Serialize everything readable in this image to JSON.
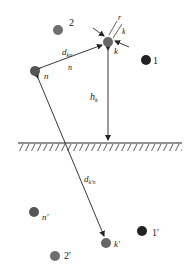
{
  "diagram": {
    "type": "antenna-element-image-method",
    "ground": {
      "label": "ground-plane",
      "y": 143,
      "x1": 18,
      "x2": 182
    },
    "nodes": [
      {
        "id": "k",
        "label": "k",
        "x": 108,
        "y": 42,
        "color": "#666666"
      },
      {
        "id": "n",
        "label": "n",
        "x": 35,
        "y": 71,
        "color": "#555555"
      },
      {
        "id": "2",
        "label": "2",
        "x": 58,
        "y": 30,
        "color": "#6e6e6e"
      },
      {
        "id": "1",
        "label": "1",
        "x": 146,
        "y": 60,
        "color": "#222222"
      },
      {
        "id": "n_img",
        "label": "n'",
        "x": 34,
        "y": 212,
        "color": "#555555"
      },
      {
        "id": "k_img",
        "label": "k'",
        "x": 106,
        "y": 243,
        "color": "#666666"
      },
      {
        "id": "1_img",
        "label": "1'",
        "x": 142,
        "y": 231,
        "color": "#222222"
      },
      {
        "id": "2_img",
        "label": "2'",
        "x": 55,
        "y": 256,
        "color": "#6e6e6e"
      }
    ],
    "labels": {
      "r": "r",
      "k_top": "k",
      "k_below": "k",
      "d_kn": "d",
      "d_kn_sub": "kn",
      "n_mid": "n",
      "h_k": "h",
      "h_k_sub": "k",
      "d_kpn": "d",
      "d_kpn_sub": "k'n",
      "n": "n",
      "n_img": "n'",
      "k_img": "k'",
      "one": "1",
      "two": "2",
      "one_img": "1'",
      "two_img": "2'"
    }
  }
}
